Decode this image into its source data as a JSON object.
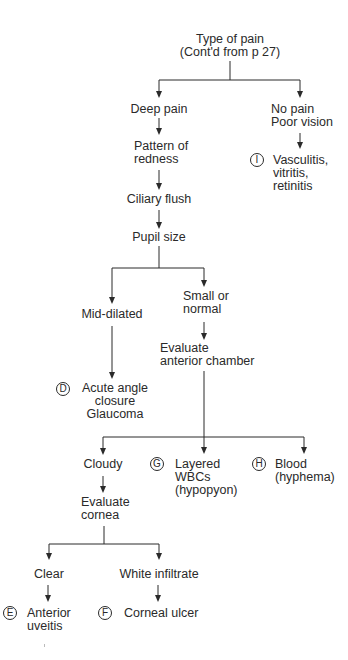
{
  "diagram": {
    "colors": {
      "line": "#2a2a2a",
      "text": "#2a2a2a",
      "background": "#ffffff"
    }
  },
  "nodes": {
    "type_of_pain": {
      "lines": [
        "Type of pain",
        "(Cont'd from p 27)"
      ]
    },
    "deep_pain": {
      "lines": [
        "Deep pain"
      ]
    },
    "pattern_of_redness": {
      "lines": [
        "Pattern of",
        "redness"
      ]
    },
    "ciliary_flush": {
      "lines": [
        "Ciliary flush"
      ]
    },
    "pupil_size": {
      "lines": [
        "Pupil size"
      ]
    },
    "mid_dilated": {
      "lines": [
        "Mid-dilated"
      ]
    },
    "small_or_normal": {
      "lines": [
        "Small or",
        "normal"
      ]
    },
    "evaluate_anterior_chamber": {
      "lines": [
        "Evaluate",
        "anterior chamber"
      ]
    },
    "cloudy": {
      "lines": [
        "Cloudy"
      ]
    },
    "evaluate_cornea": {
      "lines": [
        "Evaluate",
        "cornea"
      ]
    },
    "clear": {
      "lines": [
        "Clear"
      ]
    },
    "white_infiltrate": {
      "lines": [
        "White infiltrate"
      ]
    },
    "no_pain_poor_vision": {
      "lines": [
        "No pain",
        "Poor vision"
      ]
    }
  },
  "outcomes": {
    "D": {
      "badge": "D",
      "lines": [
        "Acute angle",
        "closure",
        "Glaucoma"
      ]
    },
    "E": {
      "badge": "E",
      "lines": [
        "Anterior",
        "uveitis"
      ]
    },
    "F": {
      "badge": "F",
      "lines": [
        "Corneal ulcer"
      ]
    },
    "G": {
      "badge": "G",
      "lines": [
        "Layered",
        "WBCs",
        "(hypopyon)"
      ]
    },
    "H": {
      "badge": "H",
      "lines": [
        "Blood",
        "(hyphema)"
      ]
    },
    "I": {
      "badge": "I",
      "lines": [
        "Vasculitis,",
        "vitritis,",
        "retinitis"
      ]
    }
  }
}
